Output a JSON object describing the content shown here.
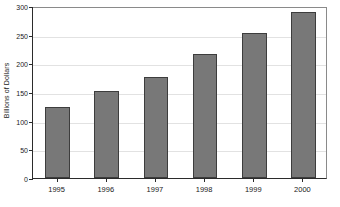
{
  "chart_data": {
    "type": "bar",
    "title": "",
    "subtitle": "",
    "xlabel": "",
    "ylabel": "Billions of Dollars",
    "categories": [
      "1995",
      "1996",
      "1997",
      "1998",
      "1999",
      "2000"
    ],
    "values": [
      123,
      151,
      176,
      217,
      253,
      290
    ],
    "series": [
      {
        "name": "Billions of Dollars",
        "values": [
          123,
          151,
          176,
          217,
          253,
          290
        ]
      }
    ],
    "ylim": [
      0,
      300
    ],
    "yticks": [
      0,
      50,
      100,
      150,
      200,
      250,
      300
    ],
    "ytick_labels": [
      "0",
      "50",
      "100",
      "150",
      "200",
      "250",
      "300"
    ],
    "grid": true,
    "grid_axis": "y",
    "legend": false,
    "legend_position": "none",
    "annotations": [],
    "colors": {
      "bar_fill": "#787878",
      "bar_edge": "#3d3d3d",
      "gridline": "#e2e2e2",
      "axis": "#2b2b2b",
      "frame": "#8a8a8a",
      "text": "#1a1a1a",
      "background": "#ffffff"
    }
  }
}
